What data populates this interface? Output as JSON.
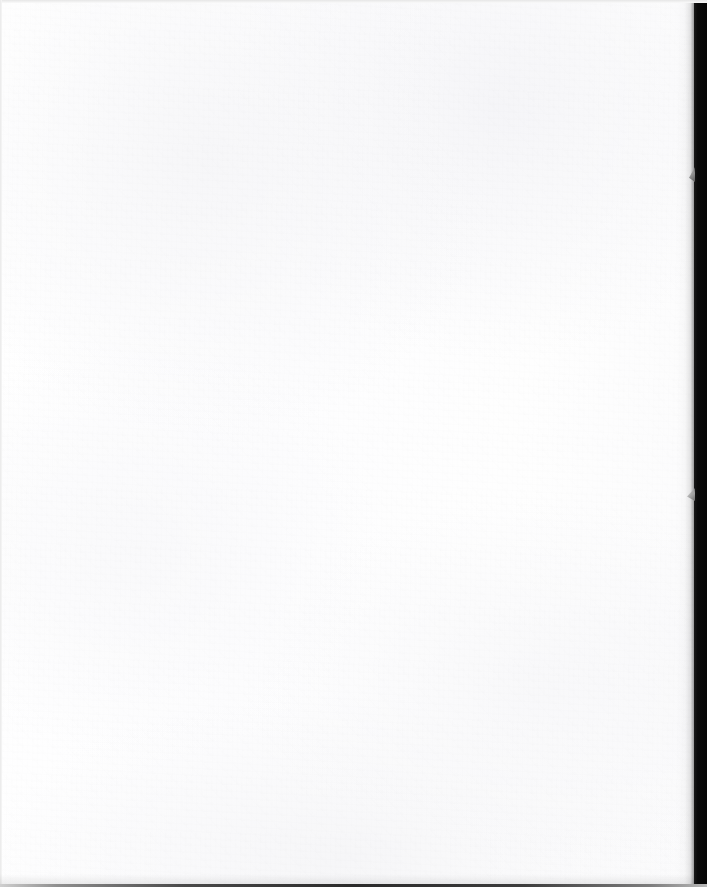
{
  "document": {
    "kind": "scanned-page",
    "content_state": "blank",
    "visible_text": "",
    "caption": "Blank scanned page"
  },
  "canvas": {
    "width_px": 707,
    "height_px": 887,
    "background_color": "#ffffff"
  },
  "page": {
    "name": "page-sheet",
    "left_px": 0,
    "top_px": 0,
    "width_px": 694,
    "height_px": 885,
    "paper_color": "#fefefe",
    "tint_color": "#fdfdfe"
  },
  "artifacts": {
    "scanner_backdrop_color": "#080808",
    "right_band": {
      "name": "dark-right-band",
      "left_px": 694,
      "width_px": 13,
      "color": "#060606"
    },
    "edge_shadow": {
      "name": "page-edge-shadow",
      "left_px": 676,
      "width_px": 20
    },
    "top_edge_line": {
      "name": "scan-edge-top",
      "height_px": 3,
      "color": "#e6e6e6"
    },
    "left_edge_line": {
      "name": "scan-edge-left",
      "width_px": 2,
      "color": "#e9e9e9"
    },
    "bottom_strip": {
      "name": "bottom-dark-strip",
      "height_px": 3,
      "color": "#2b2b2b"
    },
    "notches": [
      {
        "name": "edge-notch-upper",
        "left_px": 689,
        "top_px": 167,
        "width_px": 6,
        "height_px": 15,
        "color": "#8e8e8e"
      },
      {
        "name": "edge-notch-lower",
        "left_px": 687,
        "top_px": 488,
        "width_px": 8,
        "height_px": 13,
        "color": "#a2a2a2"
      }
    ]
  }
}
